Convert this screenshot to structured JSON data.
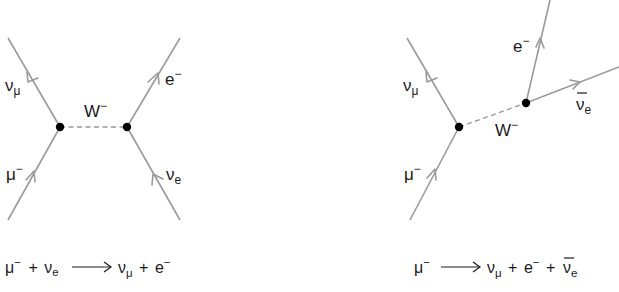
{
  "colors": {
    "line": "#9a9a9a",
    "vertex": "#000000",
    "text": "#1a1a1a",
    "background": "#ffffff"
  },
  "left_diagram": {
    "title": "muon neutrino scattering",
    "boson_label": {
      "base": "W",
      "sup": "−"
    },
    "particles": {
      "top_left": {
        "base": "ν",
        "sub": "μ"
      },
      "bottom_left": {
        "base": "μ",
        "sup": "−"
      },
      "top_right": {
        "base": "e",
        "sup": "−"
      },
      "bottom_right": {
        "base": "ν",
        "sub": "e"
      }
    },
    "equation": {
      "lhs1": {
        "base": "μ",
        "sup": "−"
      },
      "plus1": "+",
      "lhs2": {
        "base": "ν",
        "sub": "e"
      },
      "arrow": "⟶",
      "rhs1": {
        "base": "ν",
        "sub": "μ"
      },
      "plus2": "+",
      "rhs2": {
        "base": "e",
        "sup": "−"
      }
    }
  },
  "right_diagram": {
    "title": "muon decay",
    "boson_label": {
      "base": "W",
      "sup": "−"
    },
    "particles": {
      "top_left": {
        "base": "ν",
        "sub": "μ"
      },
      "bottom_left": {
        "base": "μ",
        "sup": "−"
      },
      "top_right": {
        "base": "e",
        "sup": "−"
      },
      "right": {
        "base": "ν",
        "sub": "e",
        "bar": true
      }
    },
    "equation": {
      "lhs1": {
        "base": "μ",
        "sup": "−"
      },
      "arrow": "⟶",
      "rhs1": {
        "base": "ν",
        "sub": "μ"
      },
      "plus1": "+",
      "rhs2": {
        "base": "e",
        "sup": "−"
      },
      "plus2": "+",
      "rhs3": {
        "base": "ν",
        "sub": "e",
        "bar": true
      }
    }
  }
}
